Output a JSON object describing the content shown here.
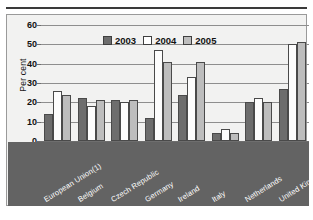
{
  "chart_data": {
    "type": "bar",
    "title": "",
    "subtitle": "",
    "xlabel": "",
    "ylabel": "Per cent",
    "ylim": [
      0,
      60
    ],
    "yticks": [
      0,
      10,
      20,
      30,
      40,
      50,
      60
    ],
    "grid": true,
    "legend_position": "top-center",
    "categories": [
      "European Union(1)",
      "Belgium",
      "Czech Republic",
      "Germany",
      "Ireland",
      "Italy",
      "Netherlands",
      "United Kingdom"
    ],
    "series": [
      {
        "name": "2003",
        "color": "#6d6d6d",
        "values": [
          14,
          22,
          21,
          12,
          24,
          4,
          20,
          27
        ]
      },
      {
        "name": "2004",
        "color": "#ffffff",
        "values": [
          26,
          18,
          20,
          47,
          33,
          6,
          22,
          50
        ]
      },
      {
        "name": "2005",
        "color": "#bdbdbd",
        "values": [
          24,
          21,
          21,
          41,
          41,
          4,
          20,
          51
        ]
      }
    ]
  }
}
